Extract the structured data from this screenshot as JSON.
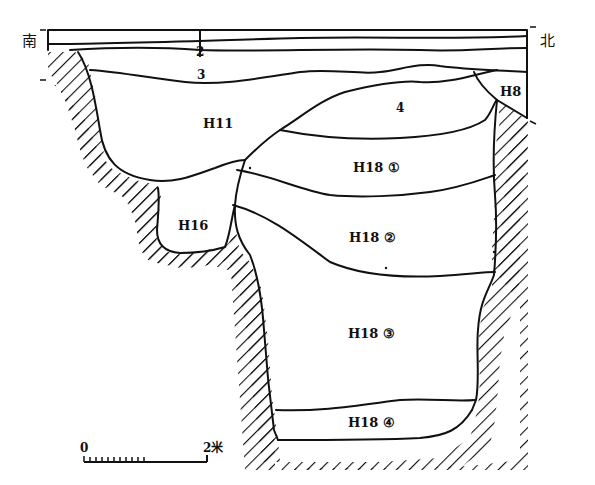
{
  "figure": {
    "type": "archaeological section drawing",
    "orientation": {
      "south_label": "南",
      "north_label": "北"
    },
    "layers": [
      {
        "id": "1",
        "label": ""
      },
      {
        "id": "2",
        "label": "2"
      },
      {
        "id": "3",
        "label": "3"
      },
      {
        "id": "4",
        "label": "4"
      }
    ],
    "features": [
      {
        "id": "H8",
        "label": "H8"
      },
      {
        "id": "H11",
        "label": "H11"
      },
      {
        "id": "H16",
        "label": "H16"
      },
      {
        "id": "H18-1",
        "label": "H18 ①"
      },
      {
        "id": "H18-2",
        "label": "H18 ②"
      },
      {
        "id": "H18-3",
        "label": "H18 ③"
      },
      {
        "id": "H18-4",
        "label": "H18 ④"
      }
    ],
    "scale_bar": {
      "start_label": "0",
      "end_label": "2米"
    }
  },
  "colors": {
    "ink": "#111111",
    "background": "#ffffff"
  }
}
